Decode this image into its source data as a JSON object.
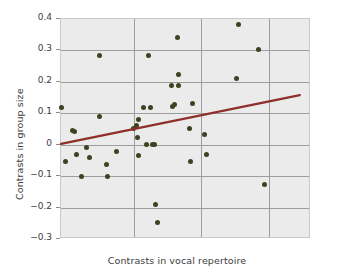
{
  "chart_data": {
    "type": "scatter",
    "title": "",
    "xlabel": "Contrasts in vocal repertoire",
    "ylabel": "Contrasts in group size",
    "xlim": [
      0,
      1
    ],
    "ylim": [
      -0.3,
      0.4
    ],
    "yticks": [
      -0.3,
      -0.2,
      -0.1,
      0,
      0.1,
      0.2,
      0.3,
      0.4
    ],
    "ytick_labels": [
      "−0.3",
      "−0.2",
      "−0.1",
      "0",
      "0.1",
      "0.2",
      "0.3",
      "0.4"
    ],
    "xticks": [],
    "xtick_labels": [],
    "grid": true,
    "grid_vertical_positions": [
      0.29,
      0.56,
      0.83
    ],
    "legend": null,
    "point_color": "#3d4320",
    "line_color": "#8e2f2a",
    "plot_background": "#ebebeb",
    "grid_color": "#9d9d9d",
    "points": [
      {
        "x": 0.003,
        "y": 0.12
      },
      {
        "x": 0.018,
        "y": -0.052
      },
      {
        "x": 0.046,
        "y": 0.046
      },
      {
        "x": 0.052,
        "y": 0.042
      },
      {
        "x": 0.06,
        "y": -0.03
      },
      {
        "x": 0.083,
        "y": -0.1
      },
      {
        "x": 0.1,
        "y": -0.01
      },
      {
        "x": 0.113,
        "y": -0.04
      },
      {
        "x": 0.152,
        "y": 0.285
      },
      {
        "x": 0.153,
        "y": 0.091
      },
      {
        "x": 0.18,
        "y": -0.062
      },
      {
        "x": 0.185,
        "y": -0.1
      },
      {
        "x": 0.222,
        "y": -0.02
      },
      {
        "x": 0.29,
        "y": 0.052
      },
      {
        "x": 0.3,
        "y": 0.06
      },
      {
        "x": 0.308,
        "y": 0.08
      },
      {
        "x": 0.307,
        "y": 0.022
      },
      {
        "x": 0.308,
        "y": -0.033
      },
      {
        "x": 0.33,
        "y": 0.12
      },
      {
        "x": 0.342,
        "y": 0.0
      },
      {
        "x": 0.35,
        "y": 0.285
      },
      {
        "x": 0.356,
        "y": 0.12
      },
      {
        "x": 0.366,
        "y": 0.0
      },
      {
        "x": 0.374,
        "y": 0.0
      },
      {
        "x": 0.378,
        "y": -0.19
      },
      {
        "x": 0.384,
        "y": -0.248
      },
      {
        "x": 0.443,
        "y": 0.19
      },
      {
        "x": 0.444,
        "y": 0.122
      },
      {
        "x": 0.452,
        "y": 0.128
      },
      {
        "x": 0.464,
        "y": 0.342
      },
      {
        "x": 0.468,
        "y": 0.222
      },
      {
        "x": 0.47,
        "y": 0.19
      },
      {
        "x": 0.514,
        "y": 0.052
      },
      {
        "x": 0.516,
        "y": -0.052
      },
      {
        "x": 0.524,
        "y": 0.13
      },
      {
        "x": 0.572,
        "y": 0.032
      },
      {
        "x": 0.58,
        "y": -0.03
      },
      {
        "x": 0.7,
        "y": 0.21
      },
      {
        "x": 0.708,
        "y": 0.382
      },
      {
        "x": 0.79,
        "y": 0.302
      },
      {
        "x": 0.812,
        "y": -0.128
      }
    ],
    "trend_line": {
      "x_start": 0.0,
      "y_start": 0.003,
      "x_end": 0.955,
      "y_end": 0.158
    }
  }
}
